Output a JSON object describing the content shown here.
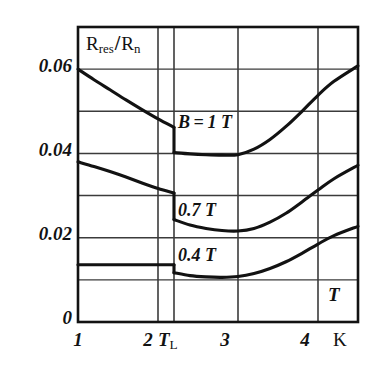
{
  "figure": {
    "kind": "scientific-line-chart",
    "background_color": "#ffffff",
    "ink_color": "#121212",
    "grid_color": "#3b3b3b",
    "frame_color": "#121212"
  },
  "chart_data": {
    "type": "line",
    "title": "",
    "subtitle": "",
    "xlabel": "T",
    "xunit": "K",
    "ylabel": "R_res/R_n",
    "ylabel_parts": {
      "main": "R",
      "main_sub": "res",
      "separator": "/",
      "denom": "R",
      "denom_sub": "n"
    },
    "xlim": [
      1,
      4.5
    ],
    "ylim": [
      0,
      0.07
    ],
    "grid": true,
    "grid_x": [
      2,
      2.2,
      3,
      4
    ],
    "grid_y": [
      0.01,
      0.02,
      0.03,
      0.04,
      0.05,
      0.06
    ],
    "xticks": [
      1,
      2,
      2.2,
      3,
      4
    ],
    "xtick_labels": [
      "1",
      "2",
      "T_L",
      "3",
      "4"
    ],
    "yticks": [
      0,
      0.02,
      0.04,
      0.06
    ],
    "ytick_labels": [
      "0",
      "0.02",
      "0.04",
      "0.06"
    ],
    "legend_position": "inline-annotations",
    "transition_temperature": 2.2,
    "transition_label": "T_L",
    "series": [
      {
        "name": "B = 1 T",
        "label": "B = 1 T",
        "label_x": 2.45,
        "label_y": 0.0437,
        "points_before_transition": [
          [
            1.0,
            0.06
          ],
          [
            1.2,
            0.0575
          ],
          [
            1.4,
            0.0551
          ],
          [
            1.6,
            0.0527
          ],
          [
            1.8,
            0.0504
          ],
          [
            2.0,
            0.0482
          ],
          [
            2.2,
            0.0462
          ]
        ],
        "drop": {
          "x": 2.2,
          "from": 0.0462,
          "to": 0.0402
        },
        "points_after_transition": [
          [
            2.2,
            0.0402
          ],
          [
            2.4,
            0.0399
          ],
          [
            2.6,
            0.0397
          ],
          [
            2.8,
            0.0396
          ],
          [
            3.0,
            0.0397
          ],
          [
            3.2,
            0.041
          ],
          [
            3.4,
            0.0433
          ],
          [
            3.6,
            0.0464
          ],
          [
            3.8,
            0.05
          ],
          [
            4.0,
            0.0538
          ],
          [
            4.2,
            0.0571
          ],
          [
            4.5,
            0.0608
          ]
        ]
      },
      {
        "name": "0.7 T",
        "label": "0.7 T",
        "label_x": 2.45,
        "label_y": 0.0257,
        "points_before_transition": [
          [
            1.0,
            0.038
          ],
          [
            1.2,
            0.0369
          ],
          [
            1.4,
            0.0357
          ],
          [
            1.6,
            0.0344
          ],
          [
            1.8,
            0.033
          ],
          [
            2.0,
            0.0317
          ],
          [
            2.2,
            0.0306
          ]
        ],
        "drop": {
          "x": 2.2,
          "from": 0.0306,
          "to": 0.0243
        },
        "points_after_transition": [
          [
            2.2,
            0.0243
          ],
          [
            2.4,
            0.023
          ],
          [
            2.6,
            0.0222
          ],
          [
            2.8,
            0.0217
          ],
          [
            3.0,
            0.0216
          ],
          [
            3.2,
            0.0222
          ],
          [
            3.4,
            0.0237
          ],
          [
            3.6,
            0.0258
          ],
          [
            3.8,
            0.0285
          ],
          [
            4.0,
            0.0313
          ],
          [
            4.2,
            0.034
          ],
          [
            4.5,
            0.0372
          ]
        ]
      },
      {
        "name": "0.4 T",
        "label": "0.4 T",
        "label_x": 2.45,
        "label_y": 0.0158,
        "points_before_transition": [
          [
            1.0,
            0.0136
          ],
          [
            1.4,
            0.0136
          ],
          [
            1.8,
            0.0136
          ],
          [
            2.2,
            0.0136
          ]
        ],
        "drop": {
          "x": 2.2,
          "from": 0.0136,
          "to": 0.0117
        },
        "points_after_transition": [
          [
            2.2,
            0.0117
          ],
          [
            2.4,
            0.011
          ],
          [
            2.6,
            0.0107
          ],
          [
            2.8,
            0.0106
          ],
          [
            3.0,
            0.0108
          ],
          [
            3.2,
            0.0115
          ],
          [
            3.4,
            0.0127
          ],
          [
            3.6,
            0.0143
          ],
          [
            3.8,
            0.0163
          ],
          [
            4.0,
            0.0185
          ],
          [
            4.2,
            0.0205
          ],
          [
            4.5,
            0.0227
          ]
        ]
      }
    ]
  },
  "axis_captions": {
    "x_axis_variable": "T",
    "x_axis_unit": "K",
    "tl_main": "T",
    "tl_sub": "L"
  }
}
